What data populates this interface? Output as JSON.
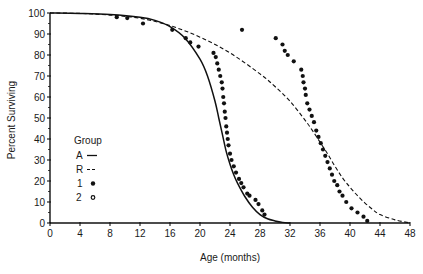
{
  "chart_data": {
    "type": "line",
    "title": "",
    "xlabel": "Age (months)",
    "ylabel": "Percent Surviving",
    "xlim": [
      0,
      48
    ],
    "ylim": [
      0,
      100
    ],
    "x_ticks": [
      0,
      4,
      8,
      12,
      16,
      20,
      24,
      28,
      32,
      36,
      40,
      44,
      48
    ],
    "y_ticks": [
      0,
      10,
      20,
      30,
      40,
      50,
      60,
      70,
      80,
      90,
      100
    ],
    "grid": false,
    "legend": {
      "title": "Group",
      "position": "lower-left inside",
      "entries": [
        {
          "label": "A",
          "symbol": "solid line"
        },
        {
          "label": "R",
          "symbol": "dashed line"
        },
        {
          "label": "1",
          "symbol": "filled circle"
        },
        {
          "label": "2",
          "symbol": "open circle"
        }
      ]
    },
    "series": [
      {
        "name": "A",
        "style": "solid",
        "x": [
          0,
          4,
          8,
          12,
          14,
          16,
          18,
          20,
          21,
          22,
          22.5,
          23,
          23.5,
          24,
          24.5,
          25,
          26,
          27,
          28,
          29,
          30,
          31,
          32
        ],
        "y": [
          100,
          99.8,
          99.3,
          98,
          96.5,
          93.5,
          88,
          78,
          70,
          58,
          50,
          42,
          34,
          28,
          23,
          19,
          12.5,
          7.5,
          4,
          2,
          1,
          0.3,
          0
        ]
      },
      {
        "name": "R",
        "style": "dashed",
        "x": [
          0,
          4,
          8,
          12,
          16,
          20,
          24,
          28,
          30,
          32,
          34,
          35,
          36,
          37,
          38,
          39,
          40,
          41,
          42,
          43,
          44,
          46,
          48
        ],
        "y": [
          100,
          99.8,
          99,
          97.5,
          94,
          88.5,
          81,
          71,
          65,
          58,
          49,
          44,
          38.5,
          33,
          27,
          21.5,
          17,
          13,
          9.5,
          6.5,
          4,
          1.5,
          0
        ]
      },
      {
        "name": "1",
        "style": "filled-points",
        "x": [
          8.9,
          10.3,
          12.4,
          16.3,
          18.1,
          18.7,
          19.8,
          21.8,
          22.1,
          22.3,
          22.5,
          22.7,
          22.9,
          23.0,
          23.1,
          23.2,
          23.3,
          23.4,
          23.5,
          23.6,
          23.7,
          23.8,
          24.0,
          24.2,
          24.5,
          24.8,
          25.2,
          25.5,
          25.8,
          26.3,
          26.6,
          27.4,
          27.8,
          28.3,
          28.6
        ],
        "y": [
          98,
          97.6,
          95,
          92,
          88,
          86,
          84,
          81,
          79,
          76,
          73,
          70,
          67,
          64,
          60,
          57,
          53,
          50,
          46,
          43,
          40,
          37,
          33,
          30,
          27,
          24,
          21,
          19,
          17,
          14,
          13,
          11,
          9,
          6,
          4
        ]
      },
      {
        "name": "2",
        "style": "filled-points",
        "x": [
          25.6,
          30.1,
          31.0,
          31.3,
          31.7,
          32.5,
          33.5,
          33.7,
          33.8,
          34.0,
          34.1,
          34.3,
          34.6,
          34.9,
          35.2,
          35.5,
          35.8,
          36.1,
          36.4,
          36.7,
          37.0,
          37.3,
          37.6,
          37.9,
          38.3,
          38.6,
          39.0,
          39.5,
          40.2,
          41.0,
          41.8,
          42.3
        ],
        "y": [
          92,
          88,
          85,
          82,
          80,
          77,
          73,
          70,
          67,
          64,
          61,
          57,
          54,
          51,
          48,
          44,
          41,
          38,
          35,
          32,
          29,
          26,
          23,
          20,
          18,
          15,
          13,
          10,
          7,
          5,
          3,
          1
        ]
      }
    ]
  },
  "labels": {
    "xlabel": "Age (months)",
    "ylabel": "Percent Surviving",
    "legend_title": "Group",
    "legend_a": "A",
    "legend_r": "R",
    "legend_1": "1",
    "legend_2": "2"
  },
  "colors": {
    "ink": "#111111",
    "background": "#ffffff"
  }
}
